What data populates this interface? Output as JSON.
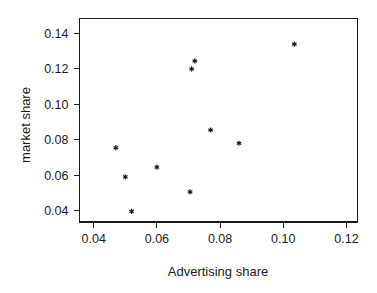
{
  "chart_data": {
    "type": "scatter",
    "title": "",
    "xlabel": "Advertising share",
    "ylabel": "market share",
    "xlim": [
      0.0355,
      0.1235
    ],
    "ylim": [
      0.0335,
      0.1485
    ],
    "xticks": [
      0.04,
      0.06,
      0.08,
      0.1,
      0.12
    ],
    "xticklabels": [
      "0.04",
      "0.06",
      "0.08",
      "0.10",
      "0.12"
    ],
    "yticks": [
      0.04,
      0.06,
      0.08,
      0.1,
      0.12,
      0.14
    ],
    "yticklabels": [
      "0.04",
      "0.06",
      "0.08",
      "0.10",
      "0.12",
      "0.14"
    ],
    "grid": false,
    "legend": null,
    "marker": "asterisk",
    "marker_color": "#111111",
    "x": [
      0.047,
      0.05,
      0.052,
      0.06,
      0.0705,
      0.071,
      0.072,
      0.077,
      0.086,
      0.1035
    ],
    "y": [
      0.0755,
      0.059,
      0.0395,
      0.0645,
      0.0505,
      0.12,
      0.1245,
      0.0855,
      0.078,
      0.134
    ],
    "points": [
      {
        "x": 0.047,
        "y": 0.0755
      },
      {
        "x": 0.05,
        "y": 0.059
      },
      {
        "x": 0.052,
        "y": 0.0395
      },
      {
        "x": 0.06,
        "y": 0.0645
      },
      {
        "x": 0.0705,
        "y": 0.0505
      },
      {
        "x": 0.071,
        "y": 0.12
      },
      {
        "x": 0.072,
        "y": 0.1245
      },
      {
        "x": 0.077,
        "y": 0.0855
      },
      {
        "x": 0.086,
        "y": 0.078
      },
      {
        "x": 0.1035,
        "y": 0.134
      }
    ]
  },
  "axis": {
    "x_title": "Advertising share",
    "y_title": "market share"
  },
  "colors": {
    "background": "#ffffff",
    "foreground": "#1a1a1a",
    "marker": "#111111"
  }
}
